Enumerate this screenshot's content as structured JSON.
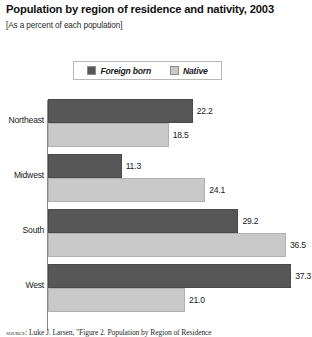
{
  "chart": {
    "title": "Population by region of residence and nativity, 2003",
    "subtitle": "[As a percent of each population]",
    "source_label": "source:",
    "source_text": "Luke J. Larsen, \"Figure 2. Population by Region of Residence"
  },
  "legend": {
    "entries": [
      {
        "label": "Foreign born",
        "color": "#575757",
        "icon": "legend-swatch-foreign-born"
      },
      {
        "label": "Native",
        "color": "#c9c9c9",
        "icon": "legend-swatch-native"
      }
    ]
  },
  "chart_data": {
    "type": "bar",
    "orientation": "horizontal",
    "title": "Population by region of residence and nativity, 2003",
    "subtitle": "[As a percent of each population]",
    "xlabel": "",
    "ylabel": "",
    "xlim": [
      0,
      36.5
    ],
    "grid": false,
    "legend_position": "top-center",
    "categories": [
      "Northeast",
      "Midwest",
      "South",
      "West"
    ],
    "series": [
      {
        "name": "Foreign born",
        "color": "#575757",
        "values": [
          22.2,
          11.3,
          29.2,
          37.3
        ]
      },
      {
        "name": "Native",
        "color": "#c9c9c9",
        "values": [
          18.5,
          24.1,
          36.5,
          21.0
        ]
      }
    ],
    "value_labels": [
      [
        "22.2",
        "18.5"
      ],
      [
        "11.3",
        "24.1"
      ],
      [
        "29.2",
        "36.5"
      ],
      [
        "37.3",
        "21.0"
      ]
    ]
  }
}
